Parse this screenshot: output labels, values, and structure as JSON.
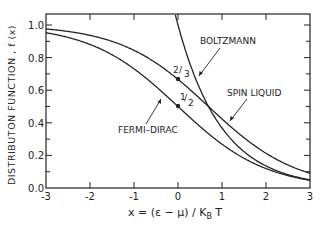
{
  "chart_data": {
    "type": "line",
    "title": "",
    "xlabel": "x = (ε − μ) / K_B T",
    "ylabel": "DISTRIBUTON FUNCTION , f (x)",
    "xlim": [
      -3,
      3
    ],
    "ylim": [
      0,
      1.0
    ],
    "x_ticks": [
      "-3",
      "-2",
      "-1",
      "0",
      "1",
      "2",
      "3"
    ],
    "y_ticks": [
      "0.0",
      "0.2",
      "0.4",
      "0.6",
      "0.8",
      "1.0"
    ],
    "grid": false,
    "legend": "none (inline annotations)",
    "series": [
      {
        "name": "FERMI-DIRAC",
        "formula": "1/(e^x+1)",
        "x": [
          -3,
          -2,
          -1,
          0,
          1,
          2,
          3
        ],
        "values": [
          0.95,
          0.88,
          0.73,
          0.5,
          0.27,
          0.12,
          0.05
        ]
      },
      {
        "name": "SPIN LIQUID",
        "formula": "2/(e^x+2)",
        "x": [
          -3,
          -2,
          -1,
          0,
          1,
          2,
          3
        ],
        "values": [
          0.98,
          0.94,
          0.84,
          0.67,
          0.42,
          0.21,
          0.09
        ]
      },
      {
        "name": "BOLTZMANN",
        "formula": "e^-x",
        "x": [
          0,
          1,
          2,
          3
        ],
        "values": [
          1.0,
          0.37,
          0.14,
          0.05
        ]
      }
    ],
    "annotations": [
      {
        "text": "BOLTZMANN",
        "target": "BOLTZMANN"
      },
      {
        "text": "SPIN LIQUID",
        "target": "SPIN LIQUID"
      },
      {
        "text": "FERMI-DIRAC",
        "target": "FERMI-DIRAC"
      },
      {
        "text": "2/3",
        "point": [
          0,
          0.667
        ]
      },
      {
        "text": "1/2",
        "point": [
          0,
          0.5
        ]
      }
    ]
  },
  "labels": {
    "ylabel": "DISTRIBUTON  FUNCTION , f (x)",
    "xlabel_main": "x = (ε − μ) / K",
    "xlabel_sub": "B",
    "xlabel_tail": " T",
    "boltzmann": "BOLTZMANN",
    "spin_liquid": "SPIN LIQUID",
    "fermi_dirac": "FERMI–DIRAC",
    "two_thirds_num": "2",
    "two_thirds_den": "3",
    "half_num": "1",
    "half_den": "2"
  }
}
